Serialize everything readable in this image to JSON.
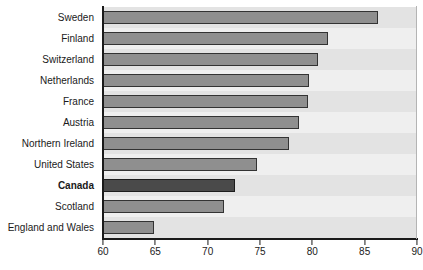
{
  "chart_data": {
    "type": "bar",
    "orientation": "horizontal",
    "title": "",
    "subtitle": "",
    "xlabel": "",
    "ylabel": "",
    "xlim": [
      60,
      90
    ],
    "xticks": [
      60,
      65,
      70,
      75,
      80,
      85,
      90
    ],
    "grid": false,
    "legend": null,
    "highlight_category": "Canada",
    "categories": [
      "Sweden",
      "Finland",
      "Switzerland",
      "Netherlands",
      "France",
      "Austria",
      "Northern Ireland",
      "United States",
      "Canada",
      "Scotland",
      "England and Wales"
    ],
    "values": [
      86.4,
      81.6,
      80.6,
      79.8,
      79.7,
      78.8,
      77.9,
      74.8,
      72.7,
      71.7,
      65.0
    ],
    "bars": [
      {
        "label": "Sweden",
        "value": 86.4,
        "highlight": false
      },
      {
        "label": "Finland",
        "value": 81.6,
        "highlight": false
      },
      {
        "label": "Switzerland",
        "value": 80.6,
        "highlight": false
      },
      {
        "label": "Netherlands",
        "value": 79.8,
        "highlight": false
      },
      {
        "label": "France",
        "value": 79.7,
        "highlight": false
      },
      {
        "label": "Austria",
        "value": 78.8,
        "highlight": false
      },
      {
        "label": "Northern Ireland",
        "value": 77.9,
        "highlight": false
      },
      {
        "label": "United States",
        "value": 74.8,
        "highlight": false
      },
      {
        "label": "Canada",
        "value": 72.7,
        "highlight": true
      },
      {
        "label": "Scotland",
        "value": 71.7,
        "highlight": false
      },
      {
        "label": "England and Wales",
        "value": 65.0,
        "highlight": false
      }
    ]
  },
  "colors": {
    "bar": "#8f8f8f",
    "bar_highlight": "#4a4a4a",
    "bar_outline": "#333333",
    "plot_background": "#e9e9e9",
    "band_dark": "#e3e3e3",
    "band_light": "#efefef",
    "axis": "#1a1a1a",
    "text": "#1a1a1a"
  }
}
